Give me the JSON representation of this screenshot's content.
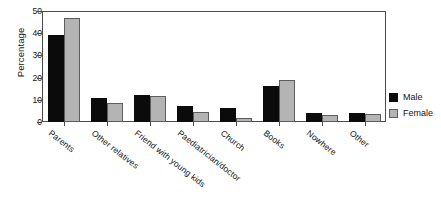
{
  "chart_data": {
    "type": "bar",
    "title": "",
    "xlabel": "",
    "ylabel": "Percentage",
    "ylim": [
      0,
      50
    ],
    "yticks": [
      0,
      10,
      20,
      30,
      40,
      50
    ],
    "grid": false,
    "legend_position": "right",
    "categories": [
      "Parents",
      "Other relatives",
      "Friend with young kids",
      "Paediatrician/doctor",
      "Church",
      "Books",
      "Nowhere",
      "Other"
    ],
    "series": [
      {
        "name": "Male",
        "color": "#0b0b0b",
        "values": [
          39,
          11,
          12,
          7,
          6.5,
          16,
          4,
          4
        ]
      },
      {
        "name": "Female",
        "color": "#b4b4b4",
        "values": [
          47,
          8.5,
          11.5,
          4.5,
          2,
          19,
          3,
          3.5
        ]
      }
    ]
  }
}
